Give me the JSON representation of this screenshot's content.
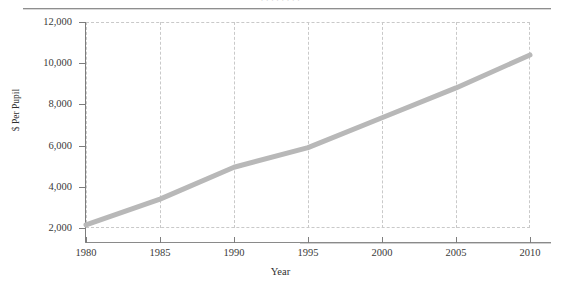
{
  "figure": {
    "background_color": "#ffffff",
    "rule_color": "#8e8e8e",
    "caption_remnant": ". . . . . . . ."
  },
  "chart_data": {
    "type": "line",
    "title": "",
    "subtitle": "",
    "xlabel": "Year",
    "ylabel": "$ Per Pupil",
    "x": [
      1980,
      1985,
      1990,
      1995,
      2000,
      2005,
      2010
    ],
    "categories": [
      "1980",
      "1985",
      "1990",
      "1995",
      "2000",
      "2005",
      "2010"
    ],
    "values": [
      2150,
      3400,
      4950,
      5900,
      7350,
      8800,
      10400
    ],
    "series": [
      {
        "name": "$ Per Pupil",
        "color": "#b8b8b8",
        "line_width": 5,
        "values": [
          2150,
          3400,
          4950,
          5900,
          7350,
          8800,
          10400
        ]
      }
    ],
    "xlim": [
      1980,
      2010
    ],
    "ylim": [
      2000,
      12000
    ],
    "ytick_labels": [
      "12,000",
      "10,000",
      "8,000",
      "6,000",
      "4,000",
      "2,000"
    ],
    "ytick_values": [
      12000,
      10000,
      8000,
      6000,
      4000,
      2000
    ],
    "xtick_labels": [
      "1980",
      "1985",
      "1990",
      "1995",
      "2000",
      "2005",
      "2010"
    ],
    "xtick_values": [
      1980,
      1985,
      1990,
      1995,
      2000,
      2005,
      2010
    ],
    "grid": true,
    "grid_style": "dashed",
    "grid_color": "#c9c9c9",
    "grid_axis": "x",
    "legend": false,
    "legend_position": "none",
    "annotations": []
  }
}
